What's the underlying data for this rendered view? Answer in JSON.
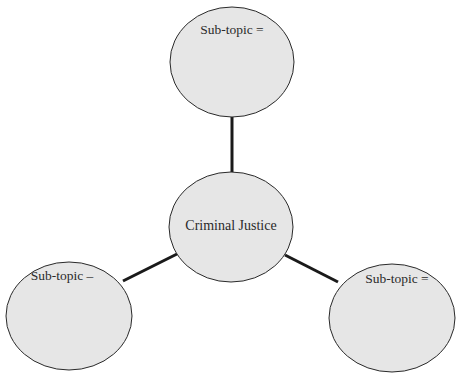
{
  "diagram": {
    "type": "concept-map",
    "colors": {
      "background": "#ffffff",
      "node_fill": "#e6e6e6",
      "node_stroke": "#2a2a2a",
      "connector": "#1a1a1a",
      "text": "#2a2a2a"
    },
    "center": {
      "label": "Criminal Justice"
    },
    "subtopics": [
      {
        "position": "top",
        "label": "Sub-topic ="
      },
      {
        "position": "bottom-left",
        "label": "Sub-topic –"
      },
      {
        "position": "bottom-right",
        "label": "Sub-topic ="
      }
    ]
  }
}
